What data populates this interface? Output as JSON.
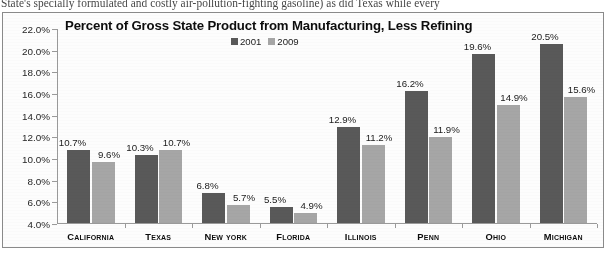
{
  "page": {
    "scan_text": "State's specially formulated and costly air-pollution-fighting gasoline) as did Texas while every"
  },
  "chart_data": {
    "type": "bar",
    "title": "Percent of Gross State Product from Manufacturing, Less Refining",
    "xlabel": "",
    "ylabel": "",
    "ylim": [
      4.0,
      22.0
    ],
    "ytick_labels": [
      "22.0%",
      "20.0%",
      "18.0%",
      "16.0%",
      "14.0%",
      "12.0%",
      "10.0%",
      "8.0%",
      "6.0%",
      "4.0%"
    ],
    "ytick_values": [
      22.0,
      20.0,
      18.0,
      16.0,
      14.0,
      12.0,
      10.0,
      8.0,
      6.0,
      4.0
    ],
    "grid": false,
    "legend_position": "top-center",
    "categories": [
      "California",
      "Texas",
      "New York",
      "Florida",
      "Illinois",
      "Penn",
      "Ohio",
      "Michigan"
    ],
    "series": [
      {
        "name": "2001",
        "color": "#595959",
        "values": [
          10.7,
          10.3,
          6.8,
          5.5,
          12.9,
          16.2,
          19.6,
          20.5
        ],
        "labels": [
          "10.7%",
          "10.3%",
          "6.8%",
          "5.5%",
          "12.9%",
          "16.2%",
          "19.6%",
          "20.5%"
        ]
      },
      {
        "name": "2009",
        "color": "#a6a6a6",
        "values": [
          9.6,
          10.7,
          5.7,
          4.9,
          11.2,
          11.9,
          14.9,
          15.6
        ],
        "labels": [
          "9.6%",
          "10.7%",
          "5.7%",
          "4.9%",
          "11.2%",
          "11.9%",
          "14.9%",
          "15.6%"
        ]
      }
    ]
  }
}
